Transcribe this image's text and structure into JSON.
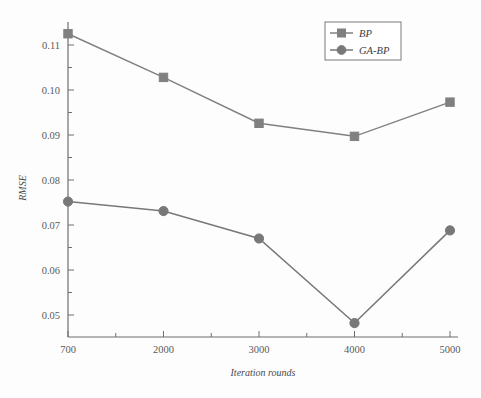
{
  "chart_data": {
    "type": "line",
    "title": "",
    "xlabel": "Iteration rounds",
    "ylabel": "RMSE",
    "categories": [
      "700",
      "2000",
      "3000",
      "4000",
      "5000"
    ],
    "x": [
      700,
      2000,
      3000,
      4000,
      5000
    ],
    "xtick_labels": [
      "700",
      "2000",
      "3000",
      "4000",
      "5000"
    ],
    "ytick_labels": [
      "0.05",
      "0.06",
      "0.07",
      "0.08",
      "0.09",
      "0.10",
      "0.11"
    ],
    "yticks": [
      0.05,
      0.06,
      0.07,
      0.08,
      0.09,
      0.1,
      0.11
    ],
    "ylim": [
      0.0455,
      0.1135
    ],
    "xlim": [
      700,
      5000
    ],
    "grid": false,
    "legend_position": "top-right",
    "series": [
      {
        "name": "BP",
        "marker": "square",
        "color": "#808080",
        "values": [
          0.1125,
          0.1028,
          0.0926,
          0.0897,
          0.0973
        ]
      },
      {
        "name": "GA-BP",
        "marker": "circle",
        "color": "#787878",
        "values": [
          0.0752,
          0.0731,
          0.067,
          0.0482,
          0.0688
        ]
      }
    ]
  },
  "legend": {
    "entries": [
      {
        "label": "BP"
      },
      {
        "label": "GA-BP"
      }
    ]
  },
  "colors": {
    "series_bp": "#808080",
    "series_gabp": "#787878",
    "axis": "#6e6e6e",
    "text": "#4a4a4a",
    "background": "#fdfdfd"
  }
}
